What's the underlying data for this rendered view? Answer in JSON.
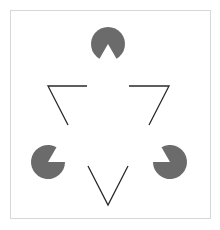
{
  "figure": {
    "title": "Kanizsa triangle illusion",
    "background": "#ffffff",
    "frame": {
      "x": 10.5,
      "y": 10.5,
      "width": 200,
      "height": 208,
      "stroke": "#d8d8d8"
    },
    "pacman_color": "#6b6b6b",
    "line_color": "#2a2a2a",
    "pacmen": [
      {
        "id": "top",
        "cx": 108,
        "cy": 44,
        "r": 17,
        "mouth_direction_deg": 90,
        "mouth_angle_deg": 60
      },
      {
        "id": "bottom-left",
        "cx": 48,
        "cy": 162,
        "r": 17,
        "mouth_direction_deg": -30,
        "mouth_angle_deg": 60
      },
      {
        "id": "bottom-right",
        "cx": 170,
        "cy": 162,
        "r": 17,
        "mouth_direction_deg": 210,
        "mouth_angle_deg": 60
      }
    ],
    "vees": [
      {
        "id": "left",
        "points": [
          [
            87,
            86
          ],
          [
            48,
            86
          ],
          [
            68,
            125
          ]
        ]
      },
      {
        "id": "right",
        "points": [
          [
            129,
            86
          ],
          [
            169,
            86
          ],
          [
            149,
            125
          ]
        ]
      },
      {
        "id": "bottom",
        "points": [
          [
            88,
            166
          ],
          [
            108,
            205
          ],
          [
            128,
            166
          ]
        ]
      }
    ]
  }
}
